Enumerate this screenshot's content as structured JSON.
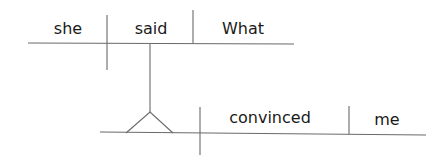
{
  "diagram": {
    "type": "sentence-diagram",
    "main_clause": {
      "subject": "she",
      "verb": "said",
      "direct_object": "What"
    },
    "noun_clause_on_pedestal": {
      "subject": "",
      "verb": "convinced",
      "direct_object": "me"
    }
  },
  "colors": {
    "line": "#6a6a6a",
    "text": "#1a1a1a",
    "background": "#ffffff"
  }
}
